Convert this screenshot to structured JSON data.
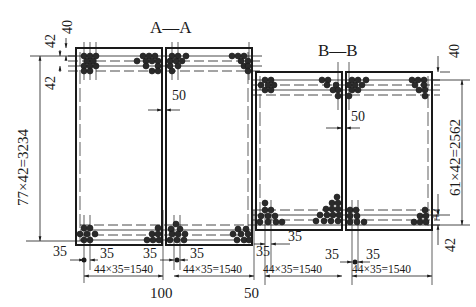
{
  "drawing": {
    "sections": [
      {
        "id": "A-A",
        "title": "A—A"
      },
      {
        "id": "B-B",
        "title": "B—B"
      }
    ],
    "dimensions": {
      "aa_top_cover": "40",
      "aa_top_spacing": "42",
      "aa_top_spacing_2": "42",
      "aa_height": "77×42=3234",
      "aa_gap": "50",
      "aa_bottom_left_edge": "35",
      "aa_bottom_left_1": "35",
      "aa_bottom_left_2": "35",
      "aa_bottom_right_1": "35",
      "aa_bottom_right_2": "35",
      "aa_width_left": "44×35=1540",
      "aa_width_right": "44×35=1540",
      "aa_center_spacing": "100",
      "between_sections": "50",
      "bb_top_cover": "40",
      "bb_height": "61×42=2562",
      "bb_bottom_spacing": "42",
      "bb_bottom_cover": "42",
      "bb_gap": "50",
      "bb_left_edge": "35",
      "bb_bottom_1": "35",
      "bb_bottom_2": "35",
      "bb_width_left": "44×35=1540",
      "bb_width_right": "44×35=1540"
    },
    "colors": {
      "ink": "#1a1a1a",
      "background": "#ffffff"
    }
  }
}
